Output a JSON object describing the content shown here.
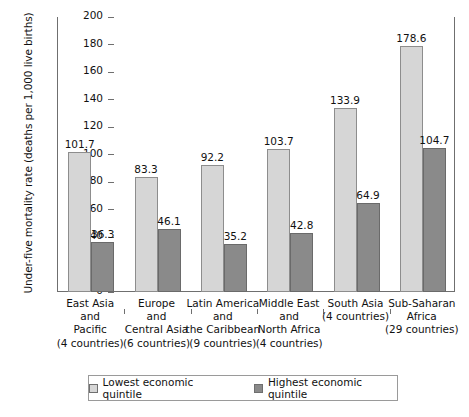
{
  "chart_data": {
    "type": "bar",
    "title": "",
    "xlabel": "",
    "ylabel": "Under-five mortality rate (deaths per 1,000 live births)",
    "ylim": [
      0,
      200
    ],
    "yticks": [
      0,
      20,
      40,
      60,
      80,
      100,
      120,
      140,
      160,
      180,
      200
    ],
    "grid": false,
    "legend_position": "bottom",
    "categories": [
      "East Asia and Pacific (4 countries)",
      "Europe and Central Asia (6 countries)",
      "Latin America and the Caribbean (9 countries)",
      "Middle East and North Africa (4 countries)",
      "South Asia (4 countries)",
      "Sub-Saharan Africa (29 countries)"
    ],
    "category_lines": [
      [
        "East Asia",
        "and",
        "Pacific",
        "(4 countries)"
      ],
      [
        "Europe",
        "and",
        "Central Asia",
        "(6 countries)"
      ],
      [
        "Latin America",
        "and",
        "the Caribbean",
        "(9 countries)"
      ],
      [
        "Middle East",
        "and",
        "North Africa",
        "(4 countries)"
      ],
      [
        "South Asia",
        "(4 countries)"
      ],
      [
        "Sub-Saharan",
        "Africa",
        "(29 countries)"
      ]
    ],
    "series": [
      {
        "name": "Lowest economic quintile",
        "color": "#d6d6d6",
        "values": [
          101.7,
          83.3,
          92.2,
          103.7,
          133.9,
          178.6
        ]
      },
      {
        "name": "Highest economic quintile",
        "color": "#8a8a8a",
        "values": [
          36.3,
          46.1,
          35.2,
          42.8,
          64.9,
          104.7
        ]
      }
    ]
  },
  "legend": {
    "items": [
      {
        "label": "Lowest economic quintile",
        "swatch": "light"
      },
      {
        "label": "Highest economic quintile",
        "swatch": "dark"
      }
    ]
  },
  "axis": {
    "y_title": "Under-five mortality rate (deaths per 1,000 live births)"
  }
}
